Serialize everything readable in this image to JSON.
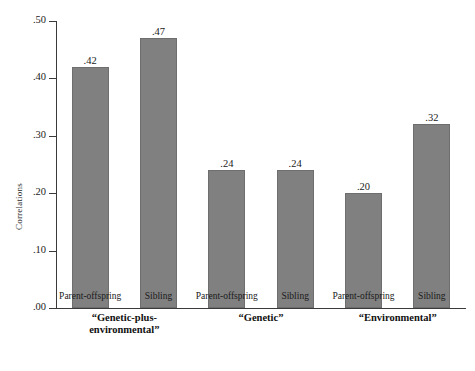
{
  "chart_data": {
    "type": "bar",
    "title": "",
    "xlabel": "",
    "ylabel": "Correlations",
    "ylim": [
      0.0,
      0.5
    ],
    "grid": false,
    "legend": "none",
    "y_ticks": [
      {
        "value": 0.5,
        "label": ".50"
      },
      {
        "value": 0.4,
        "label": ".40"
      },
      {
        "value": 0.3,
        "label": ".30"
      },
      {
        "value": 0.2,
        "label": ".20"
      },
      {
        "value": 0.1,
        "label": ".10"
      },
      {
        "value": 0.0,
        "label": ".00"
      }
    ],
    "categories": [
      "Parent-offspring",
      "Sibling",
      "Parent-offspring",
      "Sibling",
      "Parent-offspring",
      "Sibling"
    ],
    "values": [
      0.42,
      0.47,
      0.24,
      0.24,
      0.2,
      0.32
    ],
    "value_labels": [
      ".42",
      ".47",
      ".24",
      ".24",
      ".20",
      ".32"
    ],
    "groups": [
      {
        "label": "“Genetic-plus-\nenvironmental”",
        "bars": [
          0,
          1
        ]
      },
      {
        "label": "“Genetic”",
        "bars": [
          2,
          3
        ]
      },
      {
        "label": "“Environmental”",
        "bars": [
          4,
          5
        ]
      }
    ],
    "bar_color": "#808080",
    "axis_color": "#3a3a3a",
    "background_color": "#ffffff"
  }
}
